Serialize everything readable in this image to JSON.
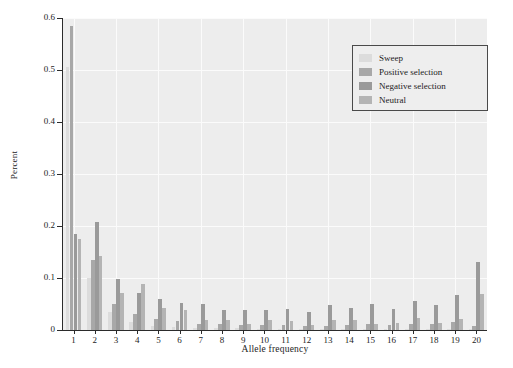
{
  "chart_data": {
    "type": "bar",
    "title": "",
    "subtitle": "",
    "xlabel": "Allele frequency",
    "ylabel": "Percent",
    "categories": [
      "1",
      "2",
      "3",
      "4",
      "5",
      "6",
      "7",
      "8",
      "9",
      "10",
      "11",
      "12",
      "13",
      "14",
      "15",
      "16",
      "17",
      "18",
      "19",
      "20"
    ],
    "series": [
      {
        "name": "Sweep",
        "color": "#dcdcdc",
        "values": [
          0.505,
          0.1,
          0.035,
          0.015,
          0.008,
          0.005,
          0.004,
          0.003,
          0.003,
          0.002,
          0.002,
          0.002,
          0.002,
          0.002,
          0.002,
          0.002,
          0.002,
          0.002,
          0.002,
          0.002
        ]
      },
      {
        "name": "Positive selection",
        "color": "#a8a8a8",
        "values": [
          0.585,
          0.135,
          0.05,
          0.03,
          0.022,
          0.018,
          0.012,
          0.012,
          0.01,
          0.01,
          0.01,
          0.008,
          0.008,
          0.01,
          0.012,
          0.01,
          0.012,
          0.012,
          0.015,
          0.008
        ]
      },
      {
        "name": "Negative selection",
        "color": "#9a9a9a",
        "values": [
          0.185,
          0.208,
          0.098,
          0.072,
          0.06,
          0.052,
          0.05,
          0.038,
          0.038,
          0.038,
          0.04,
          0.035,
          0.048,
          0.042,
          0.05,
          0.04,
          0.055,
          0.048,
          0.068,
          0.13
        ]
      },
      {
        "name": "Neutral",
        "color": "#b4b4b4",
        "values": [
          0.175,
          0.142,
          0.072,
          0.088,
          0.042,
          0.038,
          0.02,
          0.02,
          0.012,
          0.02,
          0.018,
          0.01,
          0.02,
          0.02,
          0.012,
          0.014,
          0.024,
          0.014,
          0.022,
          0.07
        ]
      }
    ],
    "ylim": [
      0,
      0.6
    ],
    "yticks": [
      "0",
      "0.1",
      "0.2",
      "0.3",
      "0.4",
      "0.5",
      "0.6"
    ],
    "ytick_values": [
      0,
      0.1,
      0.2,
      0.3,
      0.4,
      0.5,
      0.6
    ],
    "grid": true,
    "legend_position": "top-right",
    "plot_background": "#ededed",
    "gridline_color": "#fbfbfb",
    "axis_color": "#2b2b2b"
  }
}
